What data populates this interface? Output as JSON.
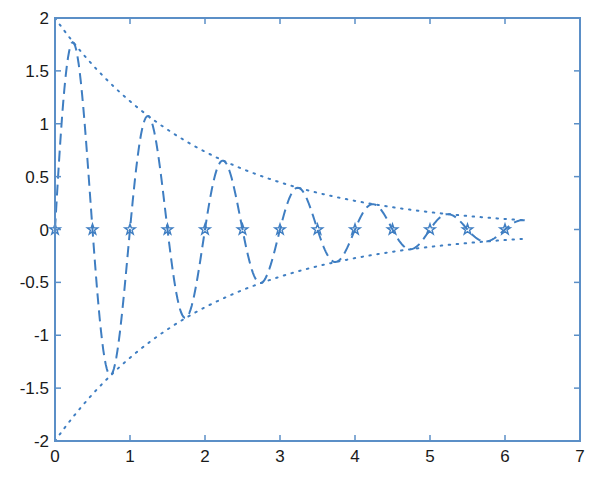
{
  "chart_data": {
    "type": "line",
    "title": "",
    "xlabel": "",
    "ylabel": "",
    "xlim": [
      0,
      7
    ],
    "ylim": [
      -2,
      2
    ],
    "grid": false,
    "legend": null,
    "x_ticks": [
      "0",
      "1",
      "2",
      "3",
      "4",
      "5",
      "6",
      "7"
    ],
    "y_ticks": [
      "-2",
      "-1.5",
      "-1",
      "-0.5",
      "0",
      "0.5",
      "1",
      "1.5",
      "2"
    ],
    "colors": {
      "axis": "#5b8fc7",
      "series": "#3f7ec2"
    },
    "series": [
      {
        "name": "damped sine",
        "style": "dashed",
        "formula": "2*exp(-0.5x)*sin(2*pi*x)",
        "x_range": [
          0,
          6.2832
        ],
        "peaks": [
          {
            "x": 0.25,
            "y": 1.76
          },
          {
            "x": 0.75,
            "y": -1.37
          },
          {
            "x": 1.25,
            "y": 1.07
          },
          {
            "x": 1.75,
            "y": -0.83
          },
          {
            "x": 2.25,
            "y": 0.65
          },
          {
            "x": 2.75,
            "y": -0.51
          },
          {
            "x": 3.25,
            "y": 0.39
          },
          {
            "x": 3.75,
            "y": -0.31
          },
          {
            "x": 4.25,
            "y": 0.24
          },
          {
            "x": 4.75,
            "y": -0.19
          },
          {
            "x": 5.25,
            "y": 0.15
          },
          {
            "x": 5.75,
            "y": -0.11
          }
        ]
      },
      {
        "name": "upper envelope",
        "style": "dotted",
        "formula": "2*exp(-0.5x)",
        "x_range": [
          0,
          6.2832
        ],
        "points": [
          {
            "x": 0,
            "y": 2
          },
          {
            "x": 1,
            "y": 1.21
          },
          {
            "x": 2,
            "y": 0.74
          },
          {
            "x": 3,
            "y": 0.45
          },
          {
            "x": 4,
            "y": 0.27
          },
          {
            "x": 5,
            "y": 0.16
          },
          {
            "x": 6,
            "y": 0.1
          },
          {
            "x": 6.28,
            "y": 0.09
          }
        ]
      },
      {
        "name": "lower envelope",
        "style": "dotted",
        "formula": "-2*exp(-0.5x)",
        "x_range": [
          0,
          6.2832
        ],
        "points": [
          {
            "x": 0,
            "y": -2
          },
          {
            "x": 1,
            "y": -1.21
          },
          {
            "x": 2,
            "y": -0.74
          },
          {
            "x": 3,
            "y": -0.45
          },
          {
            "x": 4,
            "y": -0.27
          },
          {
            "x": 5,
            "y": -0.16
          },
          {
            "x": 6,
            "y": -0.1
          },
          {
            "x": 6.28,
            "y": -0.09
          }
        ]
      },
      {
        "name": "zero crossings",
        "style": "star-markers",
        "x": [
          0,
          0.5,
          1,
          1.5,
          2,
          2.5,
          3,
          3.5,
          4,
          4.5,
          5,
          5.5,
          6
        ],
        "y": [
          0,
          0,
          0,
          0,
          0,
          0,
          0,
          0,
          0,
          0,
          0,
          0,
          0
        ]
      }
    ]
  }
}
